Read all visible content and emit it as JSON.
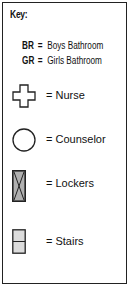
{
  "key": {
    "title": "Key:",
    "abbreviations": [
      {
        "code": "BR",
        "eq": "=",
        "meaning": "Boys Bathroom"
      },
      {
        "code": "GR",
        "eq": "=",
        "meaning": "Girls Bathroom"
      }
    ],
    "items": [
      {
        "icon": "cross-icon",
        "label": "= Nurse"
      },
      {
        "icon": "circle-icon",
        "label": "= Counselor"
      },
      {
        "icon": "locker-icon",
        "label": "= Lockers"
      },
      {
        "icon": "stairs-icon",
        "label": "= Stairs"
      }
    ]
  },
  "colors": {
    "border": "#222222",
    "icon_stroke": "#222222",
    "locker_fill": "#b0b0b0",
    "stairs_fill": "#dcdcdc"
  }
}
